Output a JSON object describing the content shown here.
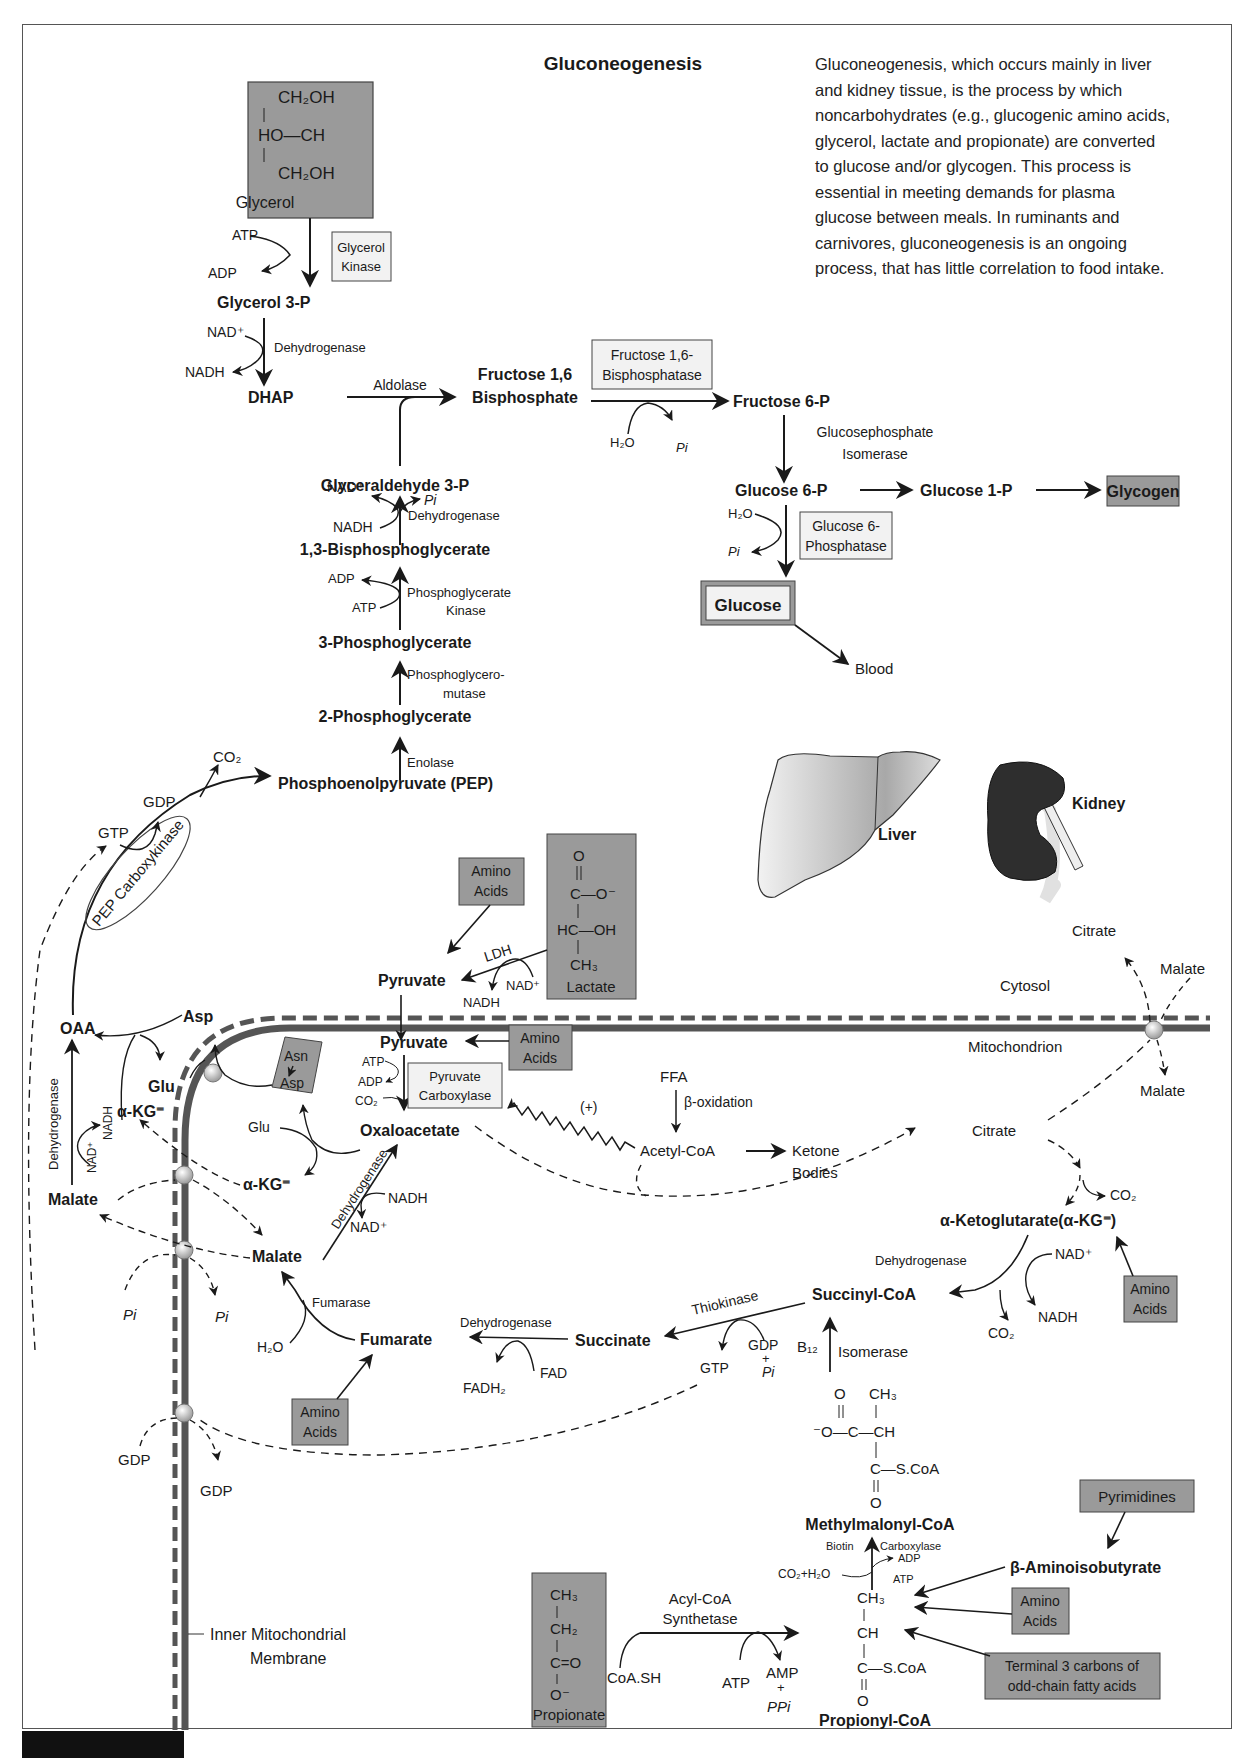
{
  "title": "Gluconeogenesis",
  "description": "Gluconeogenesis, which occurs mainly in liver and kidney tissue, is the process by which noncarbohydrates (e.g., glucogenic amino acids, glycerol, lactate and propionate) are converted to glucose and/or glycogen. This process is essential in meeting demands for plasma glucose between meals. In ruminants and carnivores, gluconeogenesis is an ongoing process, that has little correlation to food intake.",
  "colors": {
    "substrate_box": "#9a9a9a",
    "enzyme_box": "#f2f2f2",
    "membrane": "#555555",
    "kidney": "#2e2e2e",
    "liver": "#d8d8d8",
    "line": "#1a1a1a"
  },
  "glycerol_branch": {
    "glycerol_box": {
      "line1": "CH₂OH",
      "line2": "HO—CH",
      "line3": "CH₂OH",
      "label": "Glycerol"
    },
    "atp": "ATP",
    "adp": "ADP",
    "glycerol_kinase": {
      "line1": "Glycerol",
      "line2": "Kinase"
    },
    "glycerol_3p": "Glycerol 3-P",
    "nad_plus": "NAD⁺",
    "nadh": "NADH",
    "dehydrogenase": "Dehydrogenase",
    "dhap": "DHAP",
    "aldolase": "Aldolase"
  },
  "upper_path": {
    "f16bp": {
      "line1": "Fructose 1,6",
      "line2": "Bisphosphate"
    },
    "f16bpase": {
      "line1": "Fructose 1,6-",
      "line2": "Bisphosphatase"
    },
    "h2o": "H₂O",
    "pi": "Pi",
    "f6p": "Fructose 6-P",
    "isomerase": {
      "line1": "Glucosephosphate",
      "line2": "Isomerase"
    },
    "g6p": "Glucose 6-P",
    "g1p": "Glucose 1-P",
    "glycogen": "Glycogen",
    "g6pase": {
      "line1": "Glucose 6-",
      "line2": "Phosphatase"
    },
    "h2o_2": "H₂O",
    "pi_2": "Pi",
    "glucose": "Glucose",
    "blood": "Blood"
  },
  "glycolysis_reverse": {
    "g3p": "Glyceraldehyde 3-P",
    "nad_plus": "NAD⁺",
    "pi": "Pi",
    "nadh": "NADH",
    "dehydrogenase": "Dehydrogenase",
    "bpg13": "1,3-Bisphosphoglycerate",
    "adp": "ADP",
    "atp": "ATP",
    "pgk": {
      "line1": "Phosphoglycerate",
      "line2": "Kinase"
    },
    "pg3": "3-Phosphoglycerate",
    "pgm": {
      "line1": "Phosphoglycero-",
      "line2": "mutase"
    },
    "pg2": "2-Phosphoglycerate",
    "enolase": "Enolase",
    "pep": "Phosphoenolpyruvate (PEP)"
  },
  "pepck": {
    "label": "PEP Carboxykinase",
    "co2": "CO₂",
    "gdp": "GDP",
    "gtp": "GTP"
  },
  "organs": {
    "liver": "Liver",
    "kidney": "Kidney"
  },
  "cytosol_inputs": {
    "amino_acids": {
      "line1": "Amino",
      "line2": "Acids"
    },
    "lactate_box": {
      "o": "O",
      "c_line": "C—O⁻",
      "hc_line": "HC—OH",
      "ch3": "CH₃",
      "label": "Lactate"
    },
    "ldh": "LDH",
    "nad_plus": "NAD⁺",
    "nadh": "NADH",
    "pyruvate": "Pyruvate"
  },
  "compartments": {
    "cytosol": "Cytosol",
    "mitochondrion": "Mitochondrion",
    "membrane_label": {
      "line1": "Inner Mitochondrial",
      "line2": "Membrane"
    }
  },
  "mito": {
    "pyruvate": "Pyruvate",
    "amino_acids": {
      "line1": "Amino",
      "line2": "Acids"
    },
    "atp": "ATP",
    "adp": "ADP",
    "co2": "CO₂",
    "pyruvate_carboxylase": {
      "line1": "Pyruvate",
      "line2": "Carboxylase"
    },
    "oxaloacetate": "Oxaloacetate",
    "ffa": "FFA",
    "beta_oxidation": "β-oxidation",
    "acetyl_coa": "Acetyl-CoA",
    "ketone_bodies": {
      "line1": "Ketone",
      "line2": "Bodies"
    },
    "activation": "(+)",
    "citrate": "Citrate",
    "co2_2": "CO₂",
    "akg_full": "α-Ketoglutarate(α-KG⁼)",
    "akg_dehydrogenase": "Dehydrogenase",
    "nad_plus": "NAD⁺",
    "nadh": "NADH",
    "co2_3": "CO₂",
    "amino_acids_2": {
      "line1": "Amino",
      "line2": "Acids"
    },
    "succinyl_coa": "Succinyl-CoA",
    "thiokinase": "Thiokinase",
    "succinate": "Succinate",
    "gtp": "GTP",
    "gdp_pi": {
      "gdp": "GDP",
      "plus": "+",
      "pi": "Pi"
    },
    "succ_dehydrogenase": "Dehydrogenase",
    "fad": "FAD",
    "fadh2": "FADH₂",
    "fumarate": "Fumarate",
    "fumarase": "Fumarase",
    "h2o": "H₂O",
    "amino_acids_3": {
      "line1": "Amino",
      "line2": "Acids"
    },
    "malate": "Malate",
    "mdh": "Dehydrogenase",
    "nadh_2": "NADH",
    "nad_plus_2": "NAD⁺",
    "asn_asp": {
      "asn": "Asn",
      "asp": "Asp"
    },
    "glu": "Glu",
    "akg": "α-KG⁼",
    "b12": "B₁₂",
    "isomerase": "Isomerase"
  },
  "shuttle": {
    "oaa": "OAA",
    "asp": "Asp",
    "glu": "Glu",
    "akg": "α-KG⁼",
    "dehydrogenase": "Dehydrogenase",
    "nad_plus": "NAD⁺",
    "nadh": "NADH",
    "malate": "Malate",
    "pi_in": "Pi",
    "pi_out": "Pi",
    "gdp_in": "GDP",
    "gdp_out": "GDP",
    "citrate_out": "Citrate",
    "malate_in": "Malate",
    "malate_mito": "Malate"
  },
  "propionate": {
    "methylmalonyl": {
      "o": "O",
      "ch3": "CH₃",
      "chain": "⁻O—C—CH",
      "scoa": "C—S.CoA",
      "o2": "O",
      "label": "Methylmalonyl-CoA"
    },
    "biotin": "Biotin",
    "carboxylase": "Carboxylase",
    "adp": "ADP",
    "atp": "ATP",
    "co2_h2o": "CO₂+H₂O",
    "propionyl": {
      "ch3": "CH₃",
      "ch": "CH",
      "scoa": "C—S.CoA",
      "o": "O",
      "label": "Propionyl-CoA"
    },
    "propionate_box": {
      "ch3": "CH₃",
      "ch2": "CH₂",
      "co": "C=O",
      "o": "O⁻",
      "label": "Propionate"
    },
    "acyl_coa_synthetase": {
      "line1": "Acyl-CoA",
      "line2": "Synthetase"
    },
    "coash": "CoA.SH",
    "atp_2": "ATP",
    "amp_ppi": {
      "amp": "AMP",
      "plus": "+",
      "ppi": "PPi"
    },
    "pyrimidines": "Pyrimidines",
    "b_aminoisobutyrate": "β-Aminoisobutyrate",
    "amino_acids": {
      "line1": "Amino",
      "line2": "Acids"
    },
    "odd_chain": {
      "line1": "Terminal 3 carbons of",
      "line2": "odd-chain fatty acids"
    }
  }
}
